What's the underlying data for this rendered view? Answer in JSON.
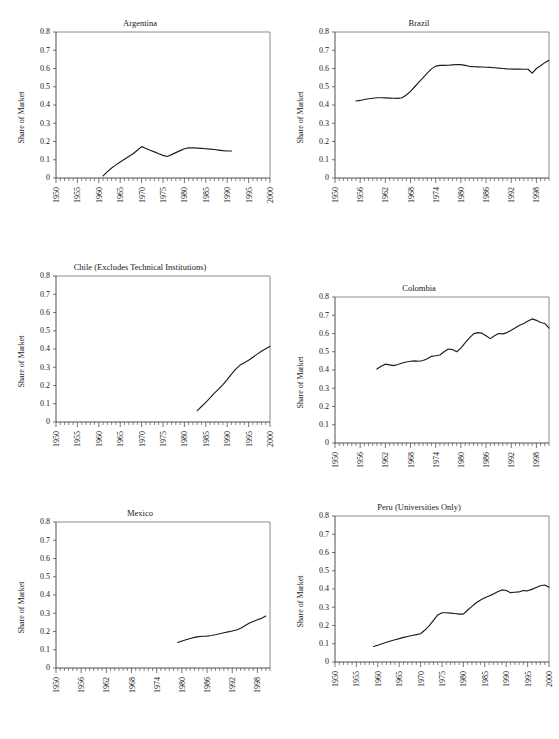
{
  "page": {
    "cropped_header_text": "",
    "background_color": "#ffffff",
    "line_color": "#1c1c1c",
    "axis_color": "#3c3c3c",
    "frame_color": "#707070"
  },
  "panels": [
    {
      "id": "argentina",
      "title": "Argentina",
      "ylabel": "Share of Market",
      "ytick_labels": [
        "0.8",
        "0.7",
        "0.6",
        "0.5",
        "0.4",
        "0.3",
        "0.2",
        "0.1",
        "0"
      ],
      "xtick_labels": [
        "1950",
        "1955",
        "1960",
        "1965",
        "1970",
        "1975",
        "1980",
        "1985",
        "1990",
        "1995",
        "2000"
      ]
    },
    {
      "id": "brazil",
      "title": "Brazil",
      "ylabel": "Share of Market",
      "ytick_labels": [
        "0.8",
        "0.7",
        "0.6",
        "0.5",
        "0.4",
        "0.3",
        "0.2",
        "0.1",
        "0"
      ],
      "xtick_labels": [
        "1950",
        "1956",
        "1962",
        "1968",
        "1974",
        "1980",
        "1986",
        "1992",
        "1998"
      ]
    },
    {
      "id": "chile",
      "title": "Chile (Excludes Technical Institutions)",
      "ylabel": "Share of Market",
      "ytick_labels": [
        "0.8",
        "0.7",
        "0.6",
        "0.5",
        "0.4",
        "0.3",
        "0.2",
        "0.1",
        "0"
      ],
      "xtick_labels": [
        "1950",
        "1955",
        "1960",
        "1965",
        "1970",
        "1975",
        "1980",
        "1985",
        "1990",
        "1995",
        "2000"
      ]
    },
    {
      "id": "colombia",
      "title": "Colombia",
      "ylabel": "Share of Market",
      "ytick_labels": [
        "0.8",
        "0.7",
        "0.6",
        "0.5",
        "0.4",
        "0.3",
        "0.2",
        "0.1",
        "0"
      ],
      "xtick_labels": [
        "1950",
        "1956",
        "1962",
        "1968",
        "1974",
        "1980",
        "1986",
        "1992",
        "1998"
      ]
    },
    {
      "id": "mexico",
      "title": "Mexico",
      "ylabel": "Share of Market",
      "ytick_labels": [
        "0.8",
        "0.7",
        "0.6",
        "0.5",
        "0.4",
        "0.3",
        "0.2",
        "0.1",
        "0"
      ],
      "xtick_labels": [
        "1950",
        "1956",
        "1962",
        "1968",
        "1974",
        "1980",
        "1986",
        "1992",
        "1998"
      ]
    },
    {
      "id": "peru",
      "title": "Peru (Universities Only)",
      "ylabel": "Share of Market",
      "ytick_labels": [
        "0.8",
        "0.7",
        "0.6",
        "0.5",
        "0.4",
        "0.3",
        "0.2",
        "0.1",
        "0"
      ],
      "xtick_labels": [
        "1950",
        "1955",
        "1960",
        "1965",
        "1970",
        "1975",
        "1980",
        "1985",
        "1990",
        "1995",
        "2000"
      ]
    }
  ],
  "chart_data": [
    {
      "type": "line",
      "title": "Argentina",
      "xlabel": "",
      "ylabel": "Share of Market",
      "xlim": [
        1950,
        2000
      ],
      "ylim": [
        0,
        0.8
      ],
      "ytick_step": 0.1,
      "xtick_step": 5,
      "grid": false,
      "legend": "none",
      "x": [
        1961,
        1962,
        1963,
        1964,
        1965,
        1966,
        1967,
        1968,
        1969,
        1970,
        1971,
        1972,
        1973,
        1974,
        1975,
        1976,
        1977,
        1978,
        1979,
        1980,
        1981,
        1982,
        1983,
        1984,
        1985,
        1986,
        1987,
        1988,
        1989,
        1990,
        1991
      ],
      "values": [
        0.012,
        0.035,
        0.055,
        0.072,
        0.088,
        0.103,
        0.118,
        0.133,
        0.152,
        0.172,
        0.162,
        0.152,
        0.143,
        0.133,
        0.124,
        0.118,
        0.128,
        0.139,
        0.15,
        0.16,
        0.165,
        0.166,
        0.164,
        0.162,
        0.16,
        0.158,
        0.156,
        0.153,
        0.15,
        0.148,
        0.148
      ]
    },
    {
      "type": "line",
      "title": "Brazil",
      "xlabel": "",
      "ylabel": "Share of Market",
      "xlim": [
        1950,
        2001
      ],
      "ylim": [
        0,
        0.8
      ],
      "ytick_step": 0.1,
      "xtick_step": 6,
      "grid": false,
      "legend": "none",
      "x": [
        1955,
        1956,
        1957,
        1958,
        1959,
        1960,
        1961,
        1962,
        1963,
        1964,
        1965,
        1966,
        1967,
        1968,
        1969,
        1970,
        1971,
        1972,
        1973,
        1974,
        1975,
        1976,
        1977,
        1978,
        1979,
        1980,
        1981,
        1982,
        1983,
        1984,
        1985,
        1986,
        1987,
        1988,
        1989,
        1990,
        1991,
        1992,
        1993,
        1994,
        1995,
        1996,
        1997,
        1998,
        1999,
        2000,
        2001
      ],
      "values": [
        0.422,
        0.425,
        0.43,
        0.434,
        0.437,
        0.44,
        0.44,
        0.439,
        0.438,
        0.437,
        0.436,
        0.44,
        0.455,
        0.475,
        0.5,
        0.525,
        0.55,
        0.575,
        0.598,
        0.613,
        0.617,
        0.617,
        0.618,
        0.62,
        0.622,
        0.621,
        0.617,
        0.612,
        0.61,
        0.609,
        0.608,
        0.607,
        0.606,
        0.604,
        0.602,
        0.6,
        0.598,
        0.597,
        0.597,
        0.597,
        0.596,
        0.596,
        0.575,
        0.6,
        0.615,
        0.632,
        0.645
      ]
    },
    {
      "type": "line",
      "title": "Chile (Excludes Technical Institutions)",
      "xlabel": "",
      "ylabel": "Share of Market",
      "xlim": [
        1950,
        2000
      ],
      "ylim": [
        0,
        0.8
      ],
      "ytick_step": 0.1,
      "xtick_step": 5,
      "grid": false,
      "legend": "none",
      "x": [
        1983,
        1984,
        1985,
        1986,
        1987,
        1988,
        1989,
        1990,
        1991,
        1992,
        1993,
        1994,
        1995,
        1996,
        1997,
        1998,
        1999,
        2000
      ],
      "values": [
        0.062,
        0.085,
        0.108,
        0.132,
        0.158,
        0.18,
        0.205,
        0.232,
        0.262,
        0.29,
        0.312,
        0.325,
        0.338,
        0.355,
        0.372,
        0.388,
        0.402,
        0.415
      ]
    },
    {
      "type": "line",
      "title": "Colombia",
      "xlabel": "",
      "ylabel": "Share of Market",
      "xlim": [
        1950,
        2001
      ],
      "ylim": [
        0,
        0.8
      ],
      "ytick_step": 0.1,
      "xtick_step": 6,
      "grid": false,
      "legend": "none",
      "x": [
        1960,
        1961,
        1962,
        1963,
        1964,
        1965,
        1966,
        1967,
        1968,
        1969,
        1970,
        1971,
        1972,
        1973,
        1974,
        1975,
        1976,
        1977,
        1978,
        1979,
        1980,
        1981,
        1982,
        1983,
        1984,
        1985,
        1986,
        1987,
        1988,
        1989,
        1990,
        1991,
        1992,
        1993,
        1994,
        1995,
        1996,
        1997,
        1998,
        1999,
        2000,
        2001
      ],
      "values": [
        0.405,
        0.42,
        0.432,
        0.428,
        0.424,
        0.43,
        0.438,
        0.444,
        0.448,
        0.45,
        0.448,
        0.452,
        0.462,
        0.475,
        0.478,
        0.482,
        0.5,
        0.515,
        0.512,
        0.5,
        0.52,
        0.548,
        0.575,
        0.598,
        0.605,
        0.602,
        0.588,
        0.572,
        0.588,
        0.6,
        0.598,
        0.605,
        0.618,
        0.632,
        0.645,
        0.655,
        0.668,
        0.68,
        0.672,
        0.66,
        0.655,
        0.63
      ]
    },
    {
      "type": "line",
      "title": "Mexico",
      "xlabel": "",
      "ylabel": "Share of Market",
      "xlim": [
        1950,
        2001
      ],
      "ylim": [
        0,
        0.8
      ],
      "ytick_step": 0.1,
      "xtick_step": 6,
      "grid": false,
      "legend": "none",
      "x": [
        1979,
        1980,
        1981,
        1982,
        1983,
        1984,
        1985,
        1986,
        1987,
        1988,
        1989,
        1990,
        1991,
        1992,
        1993,
        1994,
        1995,
        1996,
        1997,
        1998,
        1999,
        2000
      ],
      "values": [
        0.14,
        0.148,
        0.155,
        0.162,
        0.168,
        0.172,
        0.174,
        0.175,
        0.178,
        0.182,
        0.188,
        0.193,
        0.198,
        0.203,
        0.208,
        0.218,
        0.232,
        0.245,
        0.255,
        0.264,
        0.272,
        0.285
      ]
    },
    {
      "type": "line",
      "title": "Peru (Universities Only)",
      "xlabel": "",
      "ylabel": "Share of Market",
      "xlim": [
        1950,
        2000
      ],
      "ylim": [
        0,
        0.8
      ],
      "ytick_step": 0.1,
      "xtick_step": 5,
      "grid": false,
      "legend": "none",
      "x": [
        1959,
        1960,
        1961,
        1962,
        1963,
        1964,
        1965,
        1966,
        1967,
        1968,
        1969,
        1970,
        1971,
        1972,
        1973,
        1974,
        1975,
        1976,
        1977,
        1978,
        1979,
        1980,
        1981,
        1982,
        1983,
        1984,
        1985,
        1986,
        1987,
        1988,
        1989,
        1990,
        1991,
        1992,
        1993,
        1994,
        1995,
        1996,
        1997,
        1998,
        1999,
        2000
      ],
      "values": [
        0.085,
        0.092,
        0.1,
        0.108,
        0.115,
        0.122,
        0.128,
        0.135,
        0.14,
        0.145,
        0.15,
        0.155,
        0.175,
        0.198,
        0.228,
        0.258,
        0.27,
        0.27,
        0.268,
        0.266,
        0.262,
        0.262,
        0.285,
        0.305,
        0.325,
        0.34,
        0.352,
        0.362,
        0.372,
        0.385,
        0.395,
        0.392,
        0.38,
        0.382,
        0.384,
        0.392,
        0.39,
        0.398,
        0.408,
        0.418,
        0.422,
        0.41
      ]
    }
  ]
}
